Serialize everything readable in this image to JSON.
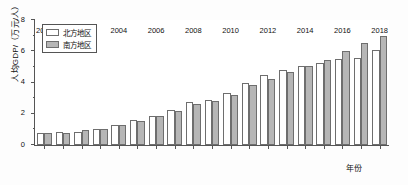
{
  "chart_data": {
    "type": "bar",
    "title": "",
    "xlabel": "年份",
    "ylabel": "人均GDP/（万元/人）",
    "ylim": [
      0,
      8
    ],
    "yticks": [
      0,
      2,
      4,
      6,
      8
    ],
    "ytick_labels": [
      "0",
      "2",
      "4",
      "6",
      "8"
    ],
    "yminor_step": 1,
    "grid": false,
    "legend_position": "top-left",
    "categories": [
      "2000",
      "2001",
      "2002",
      "2003",
      "2004",
      "2005",
      "2006",
      "2007",
      "2008",
      "2009",
      "2010",
      "2011",
      "2012",
      "2013",
      "2014",
      "2015",
      "2016",
      "2017",
      "2018"
    ],
    "xtick_labels": [
      "2000",
      "2002",
      "2004",
      "2006",
      "2008",
      "2010",
      "2012",
      "2014",
      "2016",
      "2018"
    ],
    "series": [
      {
        "name": "北方地区",
        "fill": "#ffffff",
        "values": [
          0.75,
          0.85,
          0.85,
          1.05,
          1.25,
          1.6,
          1.85,
          2.25,
          2.75,
          2.9,
          3.3,
          4.0,
          4.45,
          4.8,
          5.05,
          5.25,
          5.5,
          5.55,
          6.1
        ]
      },
      {
        "name": "南方地区",
        "fill": "#b6b6b6",
        "values": [
          0.75,
          0.8,
          0.95,
          1.05,
          1.25,
          1.55,
          1.85,
          2.2,
          2.65,
          2.8,
          3.2,
          3.85,
          4.25,
          4.7,
          5.05,
          5.45,
          6.0,
          6.55,
          7.0
        ]
      }
    ]
  }
}
